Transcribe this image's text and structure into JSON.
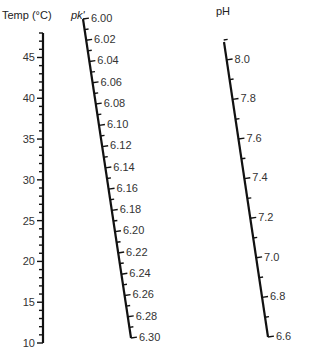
{
  "diagram": {
    "type": "nomogram",
    "axes": [
      {
        "id": "temp",
        "title": "Temp (°C)",
        "title_pos": [
          2,
          19
        ],
        "start": {
          "x": 43,
          "y": 33,
          "value": 48
        },
        "end": {
          "x": 43,
          "y": 343,
          "value": 10
        },
        "major_labels": [
          "45",
          "40",
          "35",
          "30",
          "25",
          "20",
          "15",
          "10"
        ],
        "major_values": [
          45,
          40,
          35,
          30,
          25,
          20,
          15,
          10
        ],
        "minor_step": 1,
        "label_side": "left"
      },
      {
        "id": "pk",
        "title": "pk'",
        "title_pos": [
          71,
          19
        ],
        "start": {
          "x": 83,
          "y": 19,
          "value": 6.0
        },
        "end": {
          "x": 131,
          "y": 338,
          "value": 6.3
        },
        "major_labels": [
          "6.00",
          "6.02",
          "6.04",
          "6.06",
          "6.08",
          "6.10",
          "6.12",
          "6.14",
          "6.16",
          "6.18",
          "6.20",
          "6.22",
          "6.24",
          "6.26",
          "6.28",
          "6.30"
        ],
        "major_values": [
          6.0,
          6.02,
          6.04,
          6.06,
          6.08,
          6.1,
          6.12,
          6.14,
          6.16,
          6.18,
          6.2,
          6.22,
          6.24,
          6.26,
          6.28,
          6.3
        ],
        "minor_step": 0.01,
        "label_side": "right"
      },
      {
        "id": "ph",
        "title": "pH",
        "title_pos": [
          216,
          15
        ],
        "start": {
          "x": 224,
          "y": 42,
          "value": 8.09
        },
        "end": {
          "x": 268,
          "y": 337,
          "value": 6.6
        },
        "major_labels": [
          "8.0",
          "7.8",
          "7.6",
          "7.4",
          "7.2",
          "7.0",
          "6.8",
          "6.6"
        ],
        "major_values": [
          8.0,
          7.8,
          7.6,
          7.4,
          7.2,
          7.0,
          6.8,
          6.6
        ],
        "minor_step": 0.1,
        "label_side": "right"
      }
    ]
  }
}
